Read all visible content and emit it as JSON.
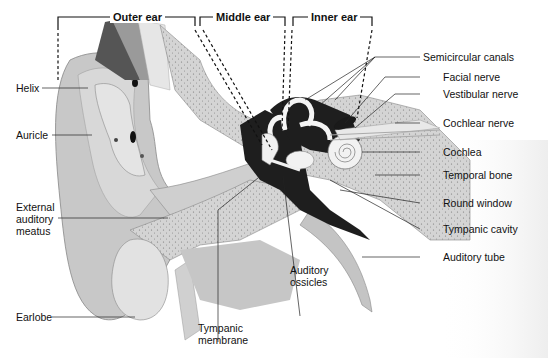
{
  "diagram": {
    "sections": [
      {
        "label": "Outer ear"
      },
      {
        "label": "Middle ear"
      },
      {
        "label": "Inner ear"
      }
    ],
    "labels_left": [
      {
        "label": "Helix"
      },
      {
        "label": "Auricle"
      },
      {
        "label": "External\nauditory\nmeatus"
      },
      {
        "label": "Earlobe"
      }
    ],
    "labels_bottom": [
      {
        "label": "Tympanic\nmembrane"
      },
      {
        "label": "Auditory\nossicles"
      }
    ],
    "labels_right": [
      {
        "label": "Semicircular canals"
      },
      {
        "label": "Facial nerve"
      },
      {
        "label": "Vestibular nerve"
      },
      {
        "label": "Cochlear nerve"
      },
      {
        "label": "Cochlea"
      },
      {
        "label": "Temporal bone"
      },
      {
        "label": "Round window"
      },
      {
        "label": "Tympanic cavity"
      },
      {
        "label": "Auditory tube"
      }
    ],
    "colors": {
      "tissue": "#c9c9c9",
      "tissue_light": "#dcdcdc",
      "bone": "#d2d2d2",
      "dark": "#1e1e1e",
      "line": "#222222"
    }
  }
}
